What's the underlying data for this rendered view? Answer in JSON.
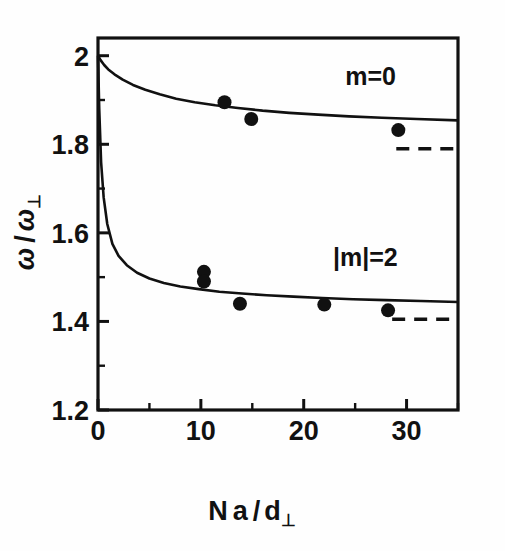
{
  "figure": {
    "name": "collective-mode-frequency-plot",
    "background": "#fefefe",
    "ink_color": "#111111"
  },
  "axes": {
    "x": {
      "label_parts": {
        "n": "N",
        "a": "a",
        "slash": "/",
        "d": "d",
        "perp": "⊥"
      },
      "label_text": "N a / d⊥",
      "min": 0,
      "max": 35,
      "major_ticks": [
        0,
        10,
        20,
        30
      ],
      "major_tick_labels": [
        "0",
        "10",
        "20",
        "30"
      ],
      "minor_ticks": [
        5,
        15,
        25,
        35
      ]
    },
    "y": {
      "label_parts": {
        "omega": "ω",
        "slash": "/",
        "omega2": "ω",
        "perp": "⊥"
      },
      "label_text": "ω / ω⊥",
      "min": 1.2,
      "max": 2.04,
      "major_ticks": [
        1.2,
        1.4,
        1.6,
        1.8,
        2.0
      ],
      "major_tick_labels": [
        "1.2",
        "1.4",
        "1.6",
        "1.8",
        "2"
      ],
      "minor_ticks": [
        1.3,
        1.5,
        1.7,
        1.9
      ]
    },
    "grid": false,
    "frame": "box"
  },
  "annotations": [
    {
      "id": "label-m0",
      "text": "m=0",
      "x": 26.5,
      "y": 1.935
    },
    {
      "id": "label-m2",
      "text": "|m|=2",
      "x": 26.0,
      "y": 1.525
    }
  ],
  "chart_data": {
    "type": "line",
    "title": "",
    "xlabel": "N a / d⊥",
    "ylabel": "ω / ω⊥",
    "xlim": [
      0,
      35
    ],
    "ylim": [
      1.2,
      2.04
    ],
    "grid": false,
    "legend": "inline-annotations",
    "series": [
      {
        "name": "m=0",
        "kind": "theory-curve",
        "style": "solid",
        "x": [
          0.0,
          0.25,
          0.6,
          1.0,
          1.6,
          2.4,
          3.4,
          4.6,
          6.0,
          7.6,
          9.4,
          11.4,
          13.6,
          16.0,
          18.6,
          21.4,
          24.4,
          27.6,
          31.0,
          35.0
        ],
        "y": [
          2.0,
          1.99,
          1.979,
          1.969,
          1.958,
          1.946,
          1.934,
          1.923,
          1.913,
          1.903,
          1.895,
          1.888,
          1.882,
          1.876,
          1.871,
          1.867,
          1.863,
          1.86,
          1.857,
          1.854
        ]
      },
      {
        "name": "|m|=2",
        "kind": "theory-curve",
        "style": "solid",
        "x": [
          0.0,
          0.12,
          0.3,
          0.55,
          0.9,
          1.4,
          2.0,
          2.8,
          3.8,
          5.0,
          6.4,
          8.0,
          9.8,
          11.8,
          14.0,
          16.4,
          19.0,
          21.8,
          24.8,
          28.0,
          31.4,
          35.0
        ],
        "y": [
          2.0,
          1.88,
          1.76,
          1.68,
          1.62,
          1.575,
          1.548,
          1.527,
          1.51,
          1.497,
          1.487,
          1.479,
          1.473,
          1.467,
          1.463,
          1.459,
          1.456,
          1.453,
          1.45,
          1.448,
          1.446,
          1.444
        ]
      },
      {
        "name": "m=0 asymptote",
        "kind": "asymptote",
        "style": "dashed",
        "x": [
          29.0,
          35.0
        ],
        "y": [
          1.79,
          1.79
        ]
      },
      {
        "name": "|m|=2 asymptote",
        "kind": "asymptote",
        "style": "dashed",
        "x": [
          28.6,
          35.0
        ],
        "y": [
          1.405,
          1.405
        ]
      }
    ],
    "scatter": [
      {
        "series": "m=0",
        "x": 12.3,
        "y": 1.895
      },
      {
        "series": "m=0",
        "x": 14.9,
        "y": 1.857
      },
      {
        "series": "m=0",
        "x": 29.2,
        "y": 1.832
      },
      {
        "series": "|m|=2",
        "x": 10.3,
        "y": 1.512
      },
      {
        "series": "|m|=2",
        "x": 10.3,
        "y": 1.49
      },
      {
        "series": "|m|=2",
        "x": 13.8,
        "y": 1.44
      },
      {
        "series": "|m|=2",
        "x": 22.0,
        "y": 1.438
      },
      {
        "series": "|m|=2",
        "x": 28.2,
        "y": 1.425
      }
    ],
    "marker": {
      "shape": "filled-circle",
      "color": "#111111",
      "radius_px": 7
    }
  }
}
